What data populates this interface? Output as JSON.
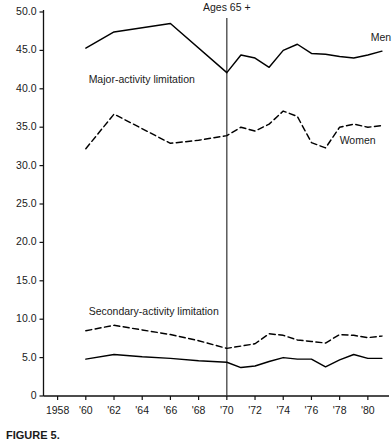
{
  "figure": {
    "caption": "FIGURE 5.",
    "annotation": "Ages 65 +"
  },
  "chart_data": {
    "type": "line",
    "title": "",
    "xlabel": "",
    "ylabel": "",
    "xlim": [
      1957,
      1981.5
    ],
    "ylim": [
      0,
      50
    ],
    "grid": false,
    "legend_position": "inline-right",
    "y_ticks": [
      "0",
      "5.0",
      "10.0",
      "15.0",
      "20.0",
      "25.0",
      "30.0",
      "35.0",
      "40.0",
      "45.0",
      "50.0"
    ],
    "y_tick_values": [
      0,
      5,
      10,
      15,
      20,
      25,
      30,
      35,
      40,
      45,
      50
    ],
    "x_ticks": [
      "1958",
      "'60",
      "'62",
      "'64",
      "'66",
      "'68",
      "'70",
      "'72",
      "'74",
      "'76",
      "'78",
      "'80"
    ],
    "x_tick_values": [
      1958,
      1960,
      1962,
      1964,
      1966,
      1968,
      1970,
      1972,
      1974,
      1976,
      1978,
      1980
    ],
    "annotations": [
      {
        "text": "Ages 65 +",
        "x": 1970,
        "y": 50.5,
        "type": "vline-label"
      },
      {
        "text": "Major-activity limitation",
        "x": 1960.2,
        "y": 41.2,
        "type": "group-label"
      },
      {
        "text": "Secondary-activity limitation",
        "x": 1960.2,
        "y": 11.0,
        "type": "group-label"
      }
    ],
    "vline": {
      "x": 1970,
      "label": "Ages 65 +"
    },
    "series": [
      {
        "name": "Men",
        "group": "Major-activity limitation",
        "style": "solid",
        "color": "#000000",
        "label_x": 1980.2,
        "label_y": 46.6,
        "x": [
          1960,
          1962,
          1966,
          1970,
          1971,
          1972,
          1973,
          1974,
          1975,
          1976,
          1977,
          1978,
          1979,
          1980,
          1981
        ],
        "values": [
          45.3,
          47.4,
          48.5,
          42.1,
          44.4,
          44.0,
          42.8,
          45.0,
          45.8,
          44.6,
          44.5,
          44.2,
          44.0,
          44.4,
          44.9
        ]
      },
      {
        "name": "Women",
        "group": "Major-activity limitation",
        "style": "dashed",
        "color": "#000000",
        "label_x": 1978.0,
        "label_y": 33.2,
        "x": [
          1960,
          1962,
          1966,
          1968,
          1970,
          1971,
          1972,
          1973,
          1974,
          1975,
          1976,
          1977,
          1978,
          1979,
          1980,
          1981
        ],
        "values": [
          32.2,
          36.7,
          32.9,
          33.3,
          33.9,
          35.0,
          34.5,
          35.4,
          37.1,
          36.4,
          33.0,
          32.3,
          35.0,
          35.4,
          35.0,
          35.2
        ]
      },
      {
        "name": "Men",
        "group": "Secondary-activity limitation",
        "style": "solid",
        "color": "#000000",
        "x": [
          1960,
          1962,
          1964,
          1966,
          1968,
          1970,
          1971,
          1972,
          1973,
          1974,
          1975,
          1976,
          1977,
          1978,
          1979,
          1980,
          1981
        ],
        "values": [
          4.8,
          5.4,
          5.1,
          4.9,
          4.6,
          4.4,
          3.7,
          3.9,
          4.5,
          5.0,
          4.8,
          4.8,
          3.8,
          4.7,
          5.4,
          4.9,
          4.9
        ]
      },
      {
        "name": "Women",
        "group": "Secondary-activity limitation",
        "style": "dashed",
        "color": "#000000",
        "x": [
          1960,
          1962,
          1964,
          1966,
          1968,
          1970,
          1971,
          1972,
          1973,
          1974,
          1975,
          1976,
          1977,
          1978,
          1979,
          1980,
          1981
        ],
        "values": [
          8.5,
          9.2,
          8.6,
          8.0,
          7.2,
          6.2,
          6.5,
          6.8,
          8.1,
          7.9,
          7.3,
          7.1,
          6.9,
          8.0,
          7.9,
          7.6,
          7.8
        ]
      }
    ]
  }
}
